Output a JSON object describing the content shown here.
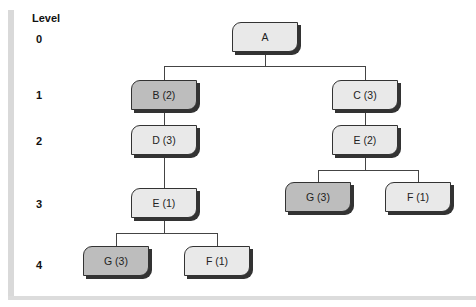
{
  "title": "Level",
  "levels": [
    "0",
    "1",
    "2",
    "3",
    "4"
  ],
  "nodes": {
    "a": "A",
    "b": "B (2)",
    "c": "C (3)",
    "d": "D (3)",
    "e_right": "E (2)",
    "e_left": "E (1)",
    "g_right": "G (3)",
    "f_right": "F (1)",
    "g_left": "G (3)",
    "f_left": "F (1)"
  },
  "colors": {
    "light_node": "#e9e9e9",
    "dark_node": "#bdbdbd",
    "line": "#444444"
  }
}
